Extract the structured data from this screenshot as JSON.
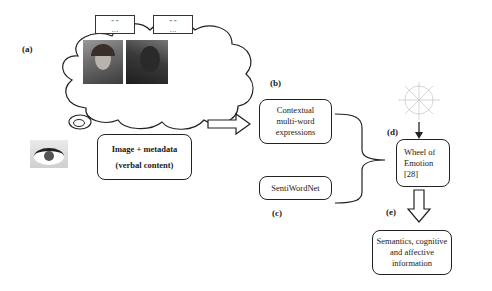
{
  "labels": {
    "a": "(a)",
    "b": "(b)",
    "c": "(c)",
    "d": "(d)",
    "e": "(e)"
  },
  "thought_cloud": {
    "speech_bubbles": [
      {
        "text": "\" \"\n…"
      },
      {
        "text": "\" \"\n…"
      }
    ],
    "images": [
      "avatar-face-image",
      "person-face-image"
    ]
  },
  "nodes": {
    "image_metadata": {
      "line1": "Image + metadata",
      "line2": "(verbal content)"
    },
    "contextual": {
      "line1": "Contextual",
      "line2": "multi-word",
      "line3": "expressions"
    },
    "sentiwordnet": {
      "line1": "SentiWordNet"
    },
    "wheel": {
      "line1": "Wheel of",
      "line2": "Emotion",
      "line3": "[28]"
    },
    "semantics": {
      "line1": "Semantics, cognitive",
      "line2": "and affective",
      "line3": "information"
    }
  },
  "icons": {
    "eye": "eye-image",
    "wheel_figure": "wheel-of-emotion-thumbnail",
    "arrow_right": "hollow-right-arrow",
    "arrow_down": "hollow-down-arrow",
    "brace": "merge-brace"
  },
  "colors": {
    "stroke": "#222222",
    "background": "#ffffff"
  }
}
